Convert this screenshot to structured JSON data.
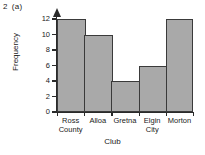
{
  "question": {
    "number": "2",
    "part": "(a)"
  },
  "chart_data": {
    "type": "bar",
    "title": "",
    "categories": [
      "Ross County",
      "Alloa",
      "Gretna",
      "Elgin City",
      "Morton"
    ],
    "category_lines": [
      [
        "Ross",
        "County"
      ],
      [
        "Alloa",
        ""
      ],
      [
        "Gretna",
        ""
      ],
      [
        "Elgin",
        "City"
      ],
      [
        "Morton",
        ""
      ]
    ],
    "values": [
      12,
      10,
      4,
      6,
      12
    ],
    "xlabel": "Club",
    "ylabel": "Frequency",
    "ylim": [
      0,
      12
    ],
    "ytick_values": [
      0,
      2,
      4,
      6,
      8,
      10,
      12
    ],
    "ytick_labels": [
      "0",
      "2",
      "4",
      "6",
      "8",
      "10",
      "12"
    ],
    "grid": false,
    "legend": false,
    "bar_fill_color": "#a9a9a9",
    "bar_border_color": "#3a3a3a",
    "axis_color": "#2a2a2a",
    "background_color": "#ffffff"
  }
}
